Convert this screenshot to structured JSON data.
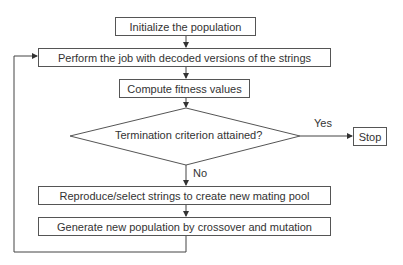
{
  "diagram": {
    "type": "flowchart",
    "nodes": {
      "init": {
        "label": "Initialize the population"
      },
      "perform": {
        "label": "Perform the job with decoded versions of the strings"
      },
      "fitness": {
        "label": "Compute fitness values"
      },
      "decision": {
        "label": "Termination criterion attained?"
      },
      "stop": {
        "label": "Stop"
      },
      "reproduce": {
        "label": "Reproduce/select strings to create new mating pool"
      },
      "generate": {
        "label": "Generate new population by crossover and mutation"
      }
    },
    "edges": {
      "yes_label": "Yes",
      "no_label": "No"
    },
    "colors": {
      "stroke": "#555555",
      "text": "#333333",
      "background": "#ffffff"
    }
  }
}
